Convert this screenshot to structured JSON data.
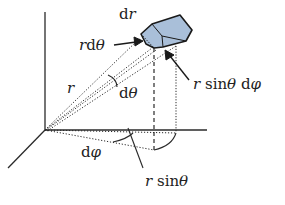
{
  "diagram": {
    "type": "spherical-coordinates-volume-element",
    "colors": {
      "line": "#2a2a2a",
      "element_fill": "#a9bfd9",
      "element_stroke": "#1a1a1a",
      "background": "#ffffff"
    },
    "labels": {
      "dr": "dr",
      "r_dtheta": "rdθ",
      "r": "r",
      "dtheta": "dθ",
      "r_sin_theta_dphi": "r sinθ dφ",
      "dphi": "dφ",
      "r_sin_theta": "r sinθ"
    }
  }
}
